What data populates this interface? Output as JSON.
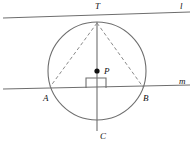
{
  "diagram": {
    "background_color": "#ffffff",
    "stroke_color": "#6e6e6e",
    "dash_color": "#8a8a8a",
    "label_color": "#111111",
    "circle": {
      "name": "main-circle",
      "center_x": 97,
      "center_y": 71,
      "radius": 49
    },
    "points": [
      {
        "id": "T",
        "label": "T",
        "x": 97,
        "y": 22,
        "label_x": 95,
        "label_y": 9,
        "dot": false
      },
      {
        "id": "P",
        "label": "P",
        "x": 97,
        "y": 71,
        "label_x": 104,
        "label_y": 74,
        "dot": true
      },
      {
        "id": "A",
        "label": "A",
        "x": 49,
        "y": 87,
        "label_x": 43,
        "label_y": 101,
        "dot": false
      },
      {
        "id": "B",
        "label": "B",
        "x": 144,
        "y": 87,
        "label_x": 143,
        "label_y": 101,
        "dot": false
      },
      {
        "id": "C",
        "label": "C",
        "x": 97,
        "y": 120,
        "label_x": 100,
        "label_y": 139,
        "dot": false
      }
    ],
    "lines": [
      {
        "id": "l",
        "label": "l",
        "role": "tangent-line",
        "x1": 3,
        "y1": 18,
        "x2": 190,
        "y2": 12,
        "label_x": 180,
        "label_y": 9,
        "dashed": false
      },
      {
        "id": "m",
        "label": "m",
        "role": "secant-line",
        "x1": 3,
        "y1": 89,
        "x2": 190,
        "y2": 85,
        "label_x": 179,
        "label_y": 84,
        "dashed": false
      }
    ],
    "segments": [
      {
        "id": "TC",
        "role": "diameter-vertical",
        "x1": 97,
        "y1": 22,
        "x2": 97,
        "y2": 131,
        "dashed": false
      },
      {
        "id": "TA",
        "role": "chord-T-to-A",
        "x1": 97,
        "y1": 23,
        "x2": 50,
        "y2": 87,
        "dashed": true
      },
      {
        "id": "TB",
        "role": "chord-T-to-B",
        "x1": 97,
        "y1": 23,
        "x2": 143,
        "y2": 87,
        "dashed": true
      }
    ],
    "right_angle": {
      "id": "right-angle-at-m",
      "role": "perpendicular-marker",
      "x": 86,
      "y": 78,
      "size": 10
    }
  }
}
